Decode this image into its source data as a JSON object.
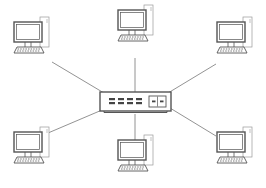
{
  "diagram": {
    "type": "star-network-topology",
    "width": 266,
    "height": 188,
    "background": "#ffffff",
    "stroke_color": "#555555",
    "line_color": "#777777",
    "hub": {
      "id": "switch",
      "kind": "network-switch",
      "x": 100,
      "y": 92,
      "w": 71,
      "h": 22,
      "port_count": 4,
      "uplink_ports": 2
    },
    "nodes": [
      {
        "id": "pc-top-left",
        "kind": "desktop-computer",
        "x": 14,
        "y": 22,
        "link_to": [
          52,
          62
        ]
      },
      {
        "id": "pc-top-center",
        "kind": "desktop-computer",
        "x": 118,
        "y": 10,
        "link_to": [
          135,
          58
        ]
      },
      {
        "id": "pc-top-right",
        "kind": "desktop-computer",
        "x": 217,
        "y": 22,
        "link_to": [
          216,
          64
        ]
      },
      {
        "id": "pc-bottom-left",
        "kind": "desktop-computer",
        "x": 14,
        "y": 132,
        "link_to": [
          48,
          133
        ]
      },
      {
        "id": "pc-bottom-center",
        "kind": "desktop-computer",
        "x": 118,
        "y": 140,
        "link_to": [
          135,
          146
        ]
      },
      {
        "id": "pc-bottom-right",
        "kind": "desktop-computer",
        "x": 217,
        "y": 132,
        "link_to": [
          216,
          136
        ]
      }
    ],
    "edges": [
      {
        "from": "switch",
        "to": "pc-top-left",
        "x1": 104,
        "y1": 93,
        "x2": 52,
        "y2": 62
      },
      {
        "from": "switch",
        "to": "pc-top-center",
        "x1": 135,
        "y1": 92,
        "x2": 135,
        "y2": 58
      },
      {
        "from": "switch",
        "to": "pc-top-right",
        "x1": 168,
        "y1": 93,
        "x2": 216,
        "y2": 64
      },
      {
        "from": "switch",
        "to": "pc-bottom-left",
        "x1": 102,
        "y1": 110,
        "x2": 48,
        "y2": 133
      },
      {
        "from": "switch",
        "to": "pc-bottom-center",
        "x1": 135,
        "y1": 114,
        "x2": 135,
        "y2": 146
      },
      {
        "from": "switch",
        "to": "pc-bottom-right",
        "x1": 170,
        "y1": 108,
        "x2": 216,
        "y2": 136
      }
    ]
  }
}
